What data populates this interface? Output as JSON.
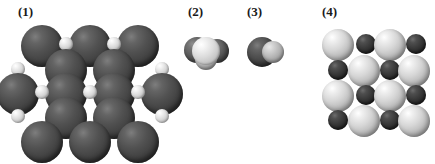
{
  "figure": {
    "background_color": "#ffffff",
    "width": 435,
    "height": 164,
    "caption": "",
    "palette": {
      "large_dark_atom": "#4a4a4a",
      "small_light_atom": "#e8e8e8",
      "large_pale_atom": "#d0d0d0",
      "small_black_atom": "#2b2b2b",
      "mid_gray_atom": "#5d5d5d",
      "label_color": "#1a1a1a"
    }
  },
  "panels": [
    {
      "id": "panel-1",
      "label": "(1)",
      "label_x": 18,
      "label_y": 5,
      "model_x": 12,
      "model_y": 24,
      "model_w": 142,
      "model_h": 128,
      "type": "extended-lattice",
      "description": "extended close-packed lattice of large dark spheres with small light spheres in the interstitial sites",
      "atoms": [
        {
          "cx": 30,
          "cy": 22,
          "r": 21,
          "kind": "large-dark"
        },
        {
          "cx": 78,
          "cy": 22,
          "r": 21,
          "kind": "large-dark"
        },
        {
          "cx": 126,
          "cy": 22,
          "r": 21,
          "kind": "large-dark"
        },
        {
          "cx": 54,
          "cy": 20,
          "r": 7,
          "kind": "small-light"
        },
        {
          "cx": 102,
          "cy": 20,
          "r": 7,
          "kind": "small-light"
        },
        {
          "cx": 6,
          "cy": 45,
          "r": 7,
          "kind": "small-light"
        },
        {
          "cx": 54,
          "cy": 45,
          "r": 7,
          "kind": "small-light"
        },
        {
          "cx": 102,
          "cy": 45,
          "r": 7,
          "kind": "small-light"
        },
        {
          "cx": 150,
          "cy": 45,
          "r": 7,
          "kind": "small-light"
        },
        {
          "cx": 54,
          "cy": 46,
          "r": 21,
          "kind": "large-dark"
        },
        {
          "cx": 102,
          "cy": 46,
          "r": 21,
          "kind": "large-dark"
        },
        {
          "cx": 6,
          "cy": 70,
          "r": 21,
          "kind": "large-dark"
        },
        {
          "cx": 54,
          "cy": 70,
          "r": 21,
          "kind": "large-dark"
        },
        {
          "cx": 102,
          "cy": 70,
          "r": 21,
          "kind": "large-dark"
        },
        {
          "cx": 150,
          "cy": 70,
          "r": 21,
          "kind": "large-dark"
        },
        {
          "cx": 30,
          "cy": 68,
          "r": 7,
          "kind": "small-light"
        },
        {
          "cx": 78,
          "cy": 68,
          "r": 7,
          "kind": "small-light"
        },
        {
          "cx": 126,
          "cy": 68,
          "r": 7,
          "kind": "small-light"
        },
        {
          "cx": 6,
          "cy": 92,
          "r": 7,
          "kind": "small-light"
        },
        {
          "cx": 54,
          "cy": 92,
          "r": 7,
          "kind": "small-light"
        },
        {
          "cx": 102,
          "cy": 92,
          "r": 7,
          "kind": "small-light"
        },
        {
          "cx": 150,
          "cy": 92,
          "r": 7,
          "kind": "small-light"
        },
        {
          "cx": 54,
          "cy": 94,
          "r": 21,
          "kind": "large-dark"
        },
        {
          "cx": 102,
          "cy": 94,
          "r": 21,
          "kind": "large-dark"
        },
        {
          "cx": 30,
          "cy": 116,
          "r": 7,
          "kind": "small-light"
        },
        {
          "cx": 78,
          "cy": 116,
          "r": 7,
          "kind": "small-light"
        },
        {
          "cx": 126,
          "cy": 116,
          "r": 7,
          "kind": "small-light"
        },
        {
          "cx": 30,
          "cy": 118,
          "r": 21,
          "kind": "large-dark"
        },
        {
          "cx": 78,
          "cy": 118,
          "r": 21,
          "kind": "large-dark"
        },
        {
          "cx": 126,
          "cy": 118,
          "r": 21,
          "kind": "large-dark"
        }
      ]
    },
    {
      "id": "panel-2",
      "label": "(2)",
      "label_x": 188,
      "label_y": 5,
      "model_x": 184,
      "model_y": 33,
      "model_w": 48,
      "model_h": 40,
      "type": "molecule-cluster",
      "description": "small molecular cluster: one light sphere in front overlapping darker spheres behind",
      "atoms": [
        {
          "cx": 13,
          "cy": 17,
          "r": 13,
          "kind": "mid-gray"
        },
        {
          "cx": 33,
          "cy": 18,
          "r": 12,
          "kind": "mid-gray"
        },
        {
          "cx": 22,
          "cy": 26,
          "r": 11,
          "kind": "dim-light"
        },
        {
          "cx": 22,
          "cy": 18,
          "r": 14,
          "kind": "small-light"
        }
      ]
    },
    {
      "id": "panel-3",
      "label": "(3)",
      "label_x": 247,
      "label_y": 5,
      "model_x": 243,
      "model_y": 33,
      "model_w": 44,
      "model_h": 40,
      "type": "diatomic-molecule",
      "description": "diatomic molecule: one large dark sphere bonded to a smaller light sphere",
      "atoms": [
        {
          "cx": 19,
          "cy": 19,
          "r": 15,
          "kind": "large-dark"
        },
        {
          "cx": 30,
          "cy": 19,
          "r": 11,
          "kind": "dim-light"
        }
      ]
    },
    {
      "id": "panel-4",
      "label": "(4)",
      "label_x": 322,
      "label_y": 5,
      "model_x": 318,
      "model_y": 30,
      "model_w": 104,
      "model_h": 104,
      "type": "ionic-lattice",
      "description": "ionic checkerboard lattice alternating large pale spheres and small dark spheres",
      "atoms": [
        {
          "cx": 20,
          "cy": 15,
          "r": 16,
          "kind": "large-pale"
        },
        {
          "cx": 48,
          "cy": 14,
          "r": 10,
          "kind": "small-black"
        },
        {
          "cx": 72,
          "cy": 15,
          "r": 16,
          "kind": "large-pale"
        },
        {
          "cx": 98,
          "cy": 14,
          "r": 10,
          "kind": "small-black"
        },
        {
          "cx": 20,
          "cy": 40,
          "r": 10,
          "kind": "small-black"
        },
        {
          "cx": 46,
          "cy": 41,
          "r": 16,
          "kind": "large-pale"
        },
        {
          "cx": 72,
          "cy": 40,
          "r": 10,
          "kind": "small-black"
        },
        {
          "cx": 96,
          "cy": 41,
          "r": 16,
          "kind": "large-pale"
        },
        {
          "cx": 20,
          "cy": 66,
          "r": 16,
          "kind": "large-pale"
        },
        {
          "cx": 48,
          "cy": 65,
          "r": 10,
          "kind": "small-black"
        },
        {
          "cx": 72,
          "cy": 66,
          "r": 16,
          "kind": "large-pale"
        },
        {
          "cx": 98,
          "cy": 65,
          "r": 10,
          "kind": "small-black"
        },
        {
          "cx": 20,
          "cy": 90,
          "r": 10,
          "kind": "small-black"
        },
        {
          "cx": 46,
          "cy": 91,
          "r": 16,
          "kind": "large-pale"
        },
        {
          "cx": 72,
          "cy": 90,
          "r": 10,
          "kind": "small-black"
        },
        {
          "cx": 96,
          "cy": 91,
          "r": 16,
          "kind": "large-pale"
        }
      ]
    }
  ]
}
